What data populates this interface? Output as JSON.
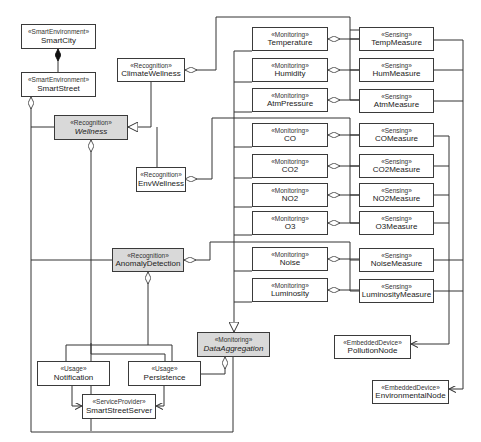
{
  "diagram": {
    "type": "UML class diagram",
    "boxes": [
      {
        "id": "smartcity",
        "stereotype": "«SmartEnvironment»",
        "name": "SmartCity",
        "x": 21,
        "y": 24,
        "w": 75,
        "h": 25,
        "fill": "white",
        "italic": false
      },
      {
        "id": "smartstreet",
        "stereotype": "«SmartEnvironment»",
        "name": "SmartStreet",
        "x": 21,
        "y": 72,
        "w": 75,
        "h": 25,
        "fill": "white",
        "italic": false
      },
      {
        "id": "climatewellness",
        "stereotype": "«Recognition»",
        "name": "ClimateWellness",
        "x": 117,
        "y": 58,
        "w": 68,
        "h": 24,
        "fill": "white",
        "italic": false
      },
      {
        "id": "wellness",
        "stereotype": "«Recognition»",
        "name": "Wellness",
        "x": 54,
        "y": 115,
        "w": 74,
        "h": 25,
        "fill": "gray",
        "italic": true
      },
      {
        "id": "envwellness",
        "stereotype": "«Recognition»",
        "name": "EnvWellness",
        "x": 136,
        "y": 167,
        "w": 50,
        "h": 25,
        "fill": "white",
        "italic": false
      },
      {
        "id": "anomalydetection",
        "stereotype": "«Recognition»",
        "name": "AnomalyDetection",
        "x": 112,
        "y": 248,
        "w": 72,
        "h": 24,
        "fill": "gray",
        "italic": false
      },
      {
        "id": "temperature",
        "stereotype": "«Monitoring»",
        "name": "Temperature",
        "x": 252,
        "y": 27,
        "w": 76,
        "h": 24,
        "fill": "white",
        "italic": false
      },
      {
        "id": "humidity",
        "stereotype": "«Monitoring»",
        "name": "Humidity",
        "x": 252,
        "y": 58,
        "w": 76,
        "h": 24,
        "fill": "white",
        "italic": false
      },
      {
        "id": "atmpressure",
        "stereotype": "«Monitoring»",
        "name": "AtmPressure",
        "x": 252,
        "y": 88,
        "w": 76,
        "h": 24,
        "fill": "white",
        "italic": false
      },
      {
        "id": "co",
        "stereotype": "«Monitoring»",
        "name": "CO",
        "x": 252,
        "y": 123,
        "w": 76,
        "h": 24,
        "fill": "white",
        "italic": false
      },
      {
        "id": "co2",
        "stereotype": "«Monitoring»",
        "name": "CO2",
        "x": 252,
        "y": 154,
        "w": 76,
        "h": 24,
        "fill": "white",
        "italic": false
      },
      {
        "id": "no2",
        "stereotype": "«Monitoring»",
        "name": "NO2",
        "x": 252,
        "y": 183,
        "w": 76,
        "h": 24,
        "fill": "white",
        "italic": false
      },
      {
        "id": "o3",
        "stereotype": "«Monitoring»",
        "name": "O3",
        "x": 252,
        "y": 211,
        "w": 76,
        "h": 24,
        "fill": "white",
        "italic": false
      },
      {
        "id": "noise",
        "stereotype": "«Monitoring»",
        "name": "Noise",
        "x": 252,
        "y": 247,
        "w": 76,
        "h": 24,
        "fill": "white",
        "italic": false
      },
      {
        "id": "luminosity",
        "stereotype": "«Monitoring»",
        "name": "Luminosity",
        "x": 252,
        "y": 278,
        "w": 76,
        "h": 24,
        "fill": "white",
        "italic": false
      },
      {
        "id": "dataaggregation",
        "stereotype": "«Monitoring»",
        "name": "DataAggregation",
        "x": 197,
        "y": 332,
        "w": 73,
        "h": 25,
        "fill": "gray",
        "italic": true
      },
      {
        "id": "tempmeasure",
        "stereotype": "«Sensing»",
        "name": "TempMeasure",
        "x": 359,
        "y": 27,
        "w": 75,
        "h": 24,
        "fill": "white",
        "italic": false
      },
      {
        "id": "hummeasure",
        "stereotype": "«Sensing»",
        "name": "HumMeasure",
        "x": 359,
        "y": 58,
        "w": 75,
        "h": 24,
        "fill": "white",
        "italic": false
      },
      {
        "id": "atmmeasure",
        "stereotype": "«Sensing»",
        "name": "AtmMeasure",
        "x": 359,
        "y": 89,
        "w": 75,
        "h": 24,
        "fill": "white",
        "italic": false
      },
      {
        "id": "comeasure",
        "stereotype": "«Sensing»",
        "name": "COMeasure",
        "x": 359,
        "y": 123,
        "w": 75,
        "h": 24,
        "fill": "white",
        "italic": false
      },
      {
        "id": "co2measure",
        "stereotype": "«Sensing»",
        "name": "CO2Measure",
        "x": 359,
        "y": 154,
        "w": 75,
        "h": 24,
        "fill": "white",
        "italic": false
      },
      {
        "id": "no2measure",
        "stereotype": "«Sensing»",
        "name": "NO2Measure",
        "x": 359,
        "y": 183,
        "w": 75,
        "h": 24,
        "fill": "white",
        "italic": false
      },
      {
        "id": "o3measure",
        "stereotype": "«Sensing»",
        "name": "O3Measure",
        "x": 359,
        "y": 211,
        "w": 75,
        "h": 24,
        "fill": "white",
        "italic": false
      },
      {
        "id": "noisemeasure",
        "stereotype": "«Sensing»",
        "name": "NoiseMeasure",
        "x": 359,
        "y": 248,
        "w": 75,
        "h": 24,
        "fill": "white",
        "italic": false
      },
      {
        "id": "luminositymeasure",
        "stereotype": "«Sensing»",
        "name": "LuminosityMeasure",
        "x": 359,
        "y": 279,
        "w": 75,
        "h": 24,
        "fill": "white",
        "italic": false
      },
      {
        "id": "pollutionnode",
        "stereotype": "«EmbeddedDevice»",
        "name": "PollutionNode",
        "x": 334,
        "y": 335,
        "w": 77,
        "h": 24,
        "fill": "white",
        "italic": false
      },
      {
        "id": "environmentalnode",
        "stereotype": "«EmbeddedDevice»",
        "name": "EnvironmentalNode",
        "x": 372,
        "y": 380,
        "w": 77,
        "h": 24,
        "fill": "white",
        "italic": false
      },
      {
        "id": "notification",
        "stereotype": "«Usage»",
        "name": "Notification",
        "x": 37,
        "y": 361,
        "w": 73,
        "h": 25,
        "fill": "white",
        "italic": false
      },
      {
        "id": "persistence",
        "stereotype": "«Usage»",
        "name": "Persistence",
        "x": 128,
        "y": 361,
        "w": 73,
        "h": 25,
        "fill": "white",
        "italic": false
      },
      {
        "id": "smartstreetserver",
        "stereotype": "«ServiceProvider»",
        "name": "SmartStreetServer",
        "x": 82,
        "y": 394,
        "w": 74,
        "h": 25,
        "fill": "white",
        "italic": false
      }
    ],
    "colors": {
      "gray_fill": "#d9d9d9",
      "line": "#333333",
      "border": "#3a3a3a"
    }
  }
}
